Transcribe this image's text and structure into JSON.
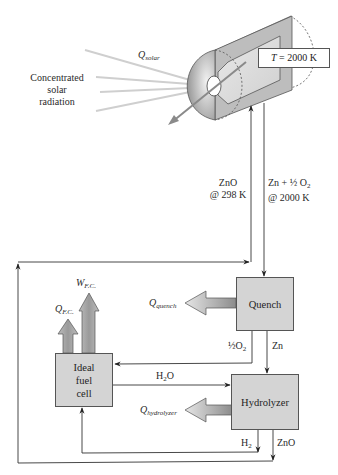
{
  "diagram": {
    "type": "process-flow",
    "source": {
      "label_lines": [
        "Concentrated",
        "solar",
        "radiation"
      ],
      "heat_label": "Q",
      "heat_sub": "solar"
    },
    "reactor": {
      "temperature_label": "T = 2000 K",
      "temperature_var": "T",
      "temperature_value": "= 2000 K"
    },
    "streams": {
      "zno_in": {
        "line1": "ZnO",
        "line2": "@ 298 K"
      },
      "products_out": {
        "line1": "Zn + ½ O",
        "line1_sub": "2",
        "line2": "@ 2000 K"
      },
      "half_o2": {
        "text": "½O",
        "sub": "2"
      },
      "zn": {
        "text": "Zn"
      },
      "h2o": {
        "text": "H",
        "sub": "2",
        "suffix": "O"
      },
      "h2": {
        "text": "H",
        "sub": "2"
      },
      "zno_out": {
        "text": "ZnO"
      }
    },
    "units": {
      "quench": {
        "label": "Quench",
        "heat_label": "Q",
        "heat_sub": "quench"
      },
      "hydrolyzer": {
        "label": "Hydrolyzer",
        "heat_label": "Q",
        "heat_sub": "hydrolyzer"
      },
      "fuel_cell": {
        "label_lines": [
          "Ideal",
          "fuel",
          "cell"
        ],
        "heat_label": "Q",
        "heat_sub": "F.C.",
        "work_label": "W",
        "work_sub": "F.C."
      }
    },
    "colors": {
      "box_fill": "#d4d4d4",
      "line": "#333333",
      "ray": "#c8c8c8",
      "reactor_dark": "#9a9a9a",
      "reactor_light": "#e2e2e2"
    }
  }
}
